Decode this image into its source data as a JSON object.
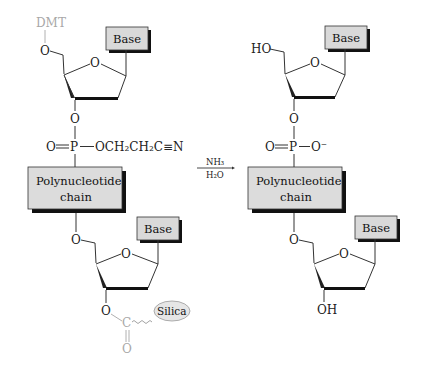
{
  "diagram": {
    "reactant": {
      "protecting_group": "DMT",
      "top_base_label": "Base",
      "ring_oxygen": "O",
      "linker_oxygen": "O",
      "phosphate": {
        "double_o": "O",
        "p": "P",
        "substituent": "OCH₂CH₂C≡N"
      },
      "chain_label_line1": "Polynucleotide",
      "chain_label_line2": "chain",
      "bottom_base_label": "Base",
      "three_prime_oxygen": "O",
      "carbonyl_c": "C",
      "carbonyl_o": "O",
      "support_label": "Silica"
    },
    "arrow": {
      "reagent_top": "NH₃",
      "reagent_bottom": "H₂O"
    },
    "product": {
      "five_prime_group": "HO",
      "top_base_label": "Base",
      "ring_oxygen": "O",
      "linker_oxygen": "O",
      "phosphate": {
        "double_o": "O",
        "p": "P",
        "substituent": "O⁻"
      },
      "chain_label_line1": "Polynucleotide",
      "chain_label_line2": "chain",
      "bottom_base_label": "Base",
      "three_prime_group": "OH"
    }
  }
}
